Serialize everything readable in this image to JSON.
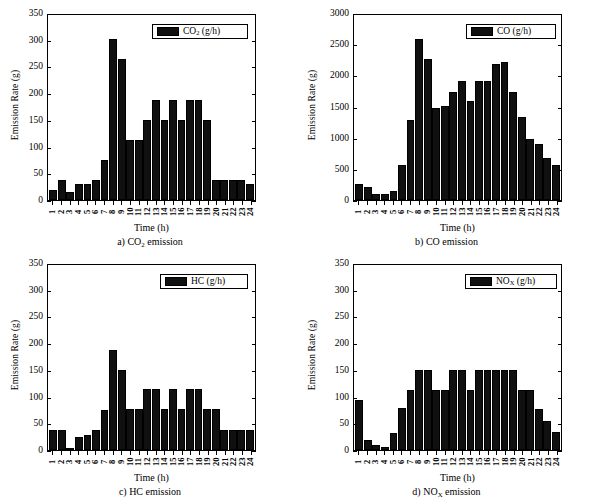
{
  "figure": {
    "background": "#ffffff",
    "bar_color": "#101010",
    "axis_color": "#000000"
  },
  "panels": [
    {
      "id": "panel-co2",
      "caption": "a) CO",
      "caption_sub": "2",
      "caption_tail": " emission",
      "legend_label": "CO",
      "legend_sub": "2",
      "legend_tail": " (g/h)",
      "xlabel": "Time (h)",
      "ylabel": "Emission Rate (g)"
    },
    {
      "id": "panel-co",
      "caption": "b) CO",
      "caption_sub": "",
      "caption_tail": " emission",
      "legend_label": "CO",
      "legend_sub": "",
      "legend_tail": " (g/h)",
      "xlabel": "Time (h)",
      "ylabel": "Emission Rate (g)"
    },
    {
      "id": "panel-hc",
      "caption": "c) HC",
      "caption_sub": "",
      "caption_tail": " emission",
      "legend_label": "HC",
      "legend_sub": "",
      "legend_tail": " (g/h)",
      "xlabel": "Time (h)",
      "ylabel": "Emission Rate (g)"
    },
    {
      "id": "panel-nox",
      "caption": "d) NO",
      "caption_sub": "X",
      "caption_tail": " emission",
      "legend_label": "NO",
      "legend_sub": "X",
      "legend_tail": " (g/h)",
      "xlabel": "Time (h)",
      "ylabel": "Emission Rate (g)"
    }
  ],
  "chart_data": [
    {
      "type": "bar",
      "title": "a) CO2 emission",
      "series_name": "CO2 (g/h)",
      "xlabel": "Time (h)",
      "ylabel": "Emission Rate (g)",
      "categories": [
        "1",
        "2",
        "3",
        "4",
        "5",
        "6",
        "7",
        "8",
        "9",
        "10",
        "11",
        "12",
        "13",
        "14",
        "15",
        "16",
        "17",
        "18",
        "19",
        "20",
        "21",
        "22",
        "23",
        "24"
      ],
      "values": [
        19,
        38,
        15,
        30,
        31,
        38,
        76,
        304,
        266,
        114,
        114,
        152,
        190,
        152,
        190,
        152,
        190,
        190,
        152,
        38,
        38,
        38,
        38,
        30
      ],
      "ylim": [
        0,
        350
      ],
      "yticks": [
        0,
        50,
        100,
        150,
        200,
        250,
        300,
        350
      ],
      "grid": false,
      "legend_position": "top-right"
    },
    {
      "type": "bar",
      "title": "b) CO emission",
      "series_name": "CO (g/h)",
      "xlabel": "Time (h)",
      "ylabel": "Emission Rate (g)",
      "categories": [
        "1",
        "2",
        "3",
        "4",
        "5",
        "6",
        "7",
        "8",
        "9",
        "10",
        "11",
        "12",
        "13",
        "14",
        "15",
        "16",
        "17",
        "18",
        "19",
        "20",
        "21",
        "22",
        "23",
        "24"
      ],
      "values": [
        255,
        215,
        100,
        100,
        140,
        565,
        1290,
        2615,
        2280,
        1485,
        1520,
        1750,
        1935,
        1600,
        1935,
        1935,
        2210,
        2245,
        1750,
        1340,
        995,
        910,
        685,
        575
      ],
      "ylim": [
        0,
        3000
      ],
      "yticks": [
        0,
        500,
        1000,
        1500,
        2000,
        2500,
        3000
      ],
      "grid": false,
      "legend_position": "top-right"
    },
    {
      "type": "bar",
      "title": "c) HC emission",
      "series_name": "HC (g/h)",
      "xlabel": "Time (h)",
      "ylabel": "Emission Rate (g)",
      "categories": [
        "1",
        "2",
        "3",
        "4",
        "5",
        "6",
        "7",
        "8",
        "9",
        "10",
        "11",
        "12",
        "13",
        "14",
        "15",
        "16",
        "17",
        "18",
        "19",
        "20",
        "21",
        "22",
        "23",
        "24"
      ],
      "values": [
        38,
        38,
        4,
        25,
        29,
        38,
        76,
        190,
        152,
        77,
        77,
        115,
        115,
        77,
        115,
        77,
        115,
        115,
        77,
        77,
        38,
        38,
        38,
        38
      ],
      "ylim": [
        0,
        350
      ],
      "yticks": [
        0,
        50,
        100,
        150,
        200,
        250,
        300,
        350
      ],
      "grid": false,
      "legend_position": "top-right"
    },
    {
      "type": "bar",
      "title": "d) NOX emission",
      "series_name": "NOX (g/h)",
      "xlabel": "Time (h)",
      "ylabel": "Emission Rate (g)",
      "categories": [
        "1",
        "2",
        "3",
        "4",
        "5",
        "6",
        "7",
        "8",
        "9",
        "10",
        "11",
        "12",
        "13",
        "14",
        "15",
        "16",
        "17",
        "18",
        "19",
        "20",
        "21",
        "22",
        "23",
        "24"
      ],
      "values": [
        94,
        19,
        10,
        5,
        32,
        80,
        114,
        152,
        152,
        114,
        114,
        152,
        152,
        114,
        152,
        152,
        152,
        152,
        152,
        114,
        114,
        77,
        54,
        35
      ],
      "ylim": [
        0,
        350
      ],
      "yticks": [
        0,
        50,
        100,
        150,
        200,
        250,
        300,
        350
      ],
      "grid": false,
      "legend_position": "top-right"
    }
  ]
}
